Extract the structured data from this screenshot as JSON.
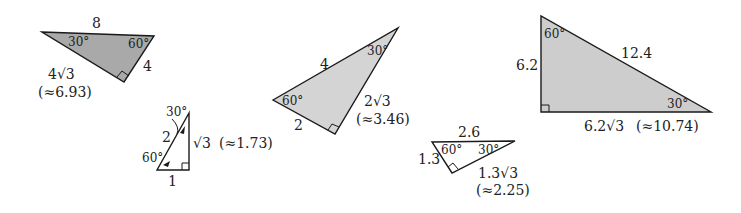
{
  "figure": {
    "colors": {
      "edge": "#1a1a1a",
      "fill_dark": "#a9a9a9",
      "fill_light": "#d4d4d4",
      "fill_mid": "#cdcdcd",
      "text": "#222222"
    },
    "triangles": [
      {
        "id": "t1",
        "hypotenuse": "8",
        "long_leg": "4√3",
        "long_leg_approx": "(≈6.93)",
        "short_leg": "4",
        "angle_small": "30°",
        "angle_large": "60°"
      },
      {
        "id": "t2",
        "hypotenuse": "2",
        "long_leg": "√3",
        "long_leg_approx": "(≈1.73)",
        "short_leg": "1",
        "angle_small": "30°",
        "angle_large": "60°"
      },
      {
        "id": "t3",
        "hypotenuse": "4",
        "long_leg": "2√3",
        "long_leg_approx": "(≈3.46)",
        "short_leg": "2",
        "angle_small": "30°",
        "angle_large": "60°"
      },
      {
        "id": "t4",
        "hypotenuse": "2.6",
        "long_leg": "1.3√3",
        "long_leg_approx": "(≈2.25)",
        "short_leg": "1.3",
        "angle_small": "30°",
        "angle_large": "60°"
      },
      {
        "id": "t5",
        "hypotenuse": "12.4",
        "long_leg": "6.2√3",
        "long_leg_approx": "(≈10.74)",
        "short_leg": "6.2",
        "angle_small": "30°",
        "angle_large": "60°"
      }
    ]
  }
}
